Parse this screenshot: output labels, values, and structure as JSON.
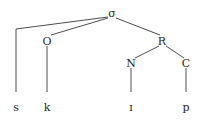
{
  "diagram": {
    "type": "syllable-tree",
    "nodes": [
      {
        "id": "sigma",
        "label": "σ"
      },
      {
        "id": "O",
        "label": "O"
      },
      {
        "id": "R",
        "label": "R"
      },
      {
        "id": "N",
        "label": "N"
      },
      {
        "id": "C",
        "label": "C"
      },
      {
        "id": "s",
        "label": "s"
      },
      {
        "id": "k",
        "label": "k"
      },
      {
        "id": "i",
        "label": "ɪ"
      },
      {
        "id": "p",
        "label": "p"
      }
    ],
    "edges": [
      [
        "sigma",
        "s"
      ],
      [
        "sigma",
        "O"
      ],
      [
        "sigma",
        "R"
      ],
      [
        "O",
        "k"
      ],
      [
        "R",
        "N"
      ],
      [
        "R",
        "C"
      ],
      [
        "N",
        "i"
      ],
      [
        "C",
        "p"
      ]
    ]
  }
}
